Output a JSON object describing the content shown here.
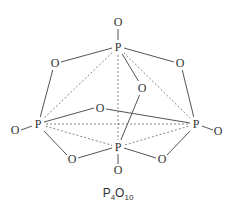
{
  "diagram": {
    "title": "P4O10",
    "label": {
      "main": "P",
      "sub1": "4",
      "mid": "O",
      "sub2": "10"
    },
    "atoms": {
      "o_top": "O",
      "p_top": "P",
      "o_upper_left": "O",
      "o_upper_right": "O",
      "o_inner": "O",
      "p_left": "P",
      "o_far_left": "O",
      "o_center": "O",
      "p_right": "P",
      "o_far_right": "O",
      "p_bottom": "P",
      "o_bottom": "O",
      "o_lower_left": "O",
      "o_lower_right": "O"
    },
    "colors": {
      "stroke": "#555555",
      "text": "#333333",
      "background": "#ffffff"
    }
  }
}
